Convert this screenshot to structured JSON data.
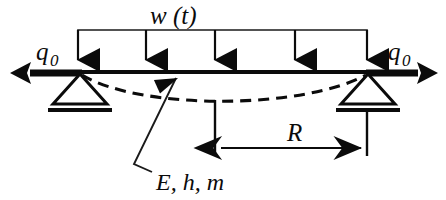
{
  "figure": {
    "name": "simply-supported-beam-distributed-load",
    "background_color": "#ffffff",
    "ink_color": "#0b0b0b"
  },
  "labels": {
    "distributed_load": "w (t)",
    "axial_load_left": "q",
    "axial_load_left_sub": "0",
    "axial_load_right": "q",
    "axial_load_right_sub": "0",
    "dimension_R": "R",
    "material_props": "E, h, m"
  },
  "geometry": {
    "beam": {
      "x1": 78,
      "y1": 72,
      "x2": 372,
      "y2": 72
    },
    "load_bracket": {
      "x_left": 78,
      "x_right": 367,
      "y": 30
    },
    "load_arrows_x": [
      78,
      146,
      215,
      295,
      367
    ],
    "load_arrow_top_y": 30,
    "load_arrow_tip_y": 70,
    "supports": [
      {
        "name": "left-pin-support",
        "apex_x": 80,
        "apex_y": 73,
        "half_width": 27,
        "height": 30,
        "ground_y": 107,
        "ground_half_width": 32
      },
      {
        "name": "right-pin-support",
        "apex_x": 368,
        "apex_y": 73,
        "half_width": 27,
        "height": 30,
        "ground_y": 107,
        "ground_half_width": 32
      }
    ],
    "axial_arrows": [
      {
        "name": "left-axial-arrow",
        "x_tail": 80,
        "x_tip": 12,
        "y": 73
      },
      {
        "name": "right-axial-arrow",
        "x_tail": 368,
        "x_tip": 436,
        "y": 73
      }
    ],
    "deflection_curve": {
      "x_start": 80,
      "y_start": 74,
      "x_mid": 228,
      "y_sag": 102,
      "x_end": 368,
      "y_end": 74
    },
    "dimension_R_line": {
      "x_left": 215,
      "x_right": 367,
      "y": 148
    },
    "extension_lines": [
      {
        "x": 215,
        "y_top": 100,
        "y_bottom": 155
      },
      {
        "x": 367,
        "y_top": 110,
        "y_bottom": 155
      }
    ],
    "leader": {
      "x_tip": 178,
      "y_tip": 76,
      "x_bend": 134,
      "y_bend": 164,
      "x_end": 152,
      "y_end": 172
    }
  },
  "label_positions": {
    "distributed_load": {
      "x": 150,
      "y": 24
    },
    "axial_load_left": {
      "x": 36,
      "y": 60
    },
    "axial_load_right": {
      "x": 388,
      "y": 60
    },
    "dimension_R": {
      "x": 287,
      "y": 141
    },
    "material_props": {
      "x": 156,
      "y": 190
    }
  }
}
